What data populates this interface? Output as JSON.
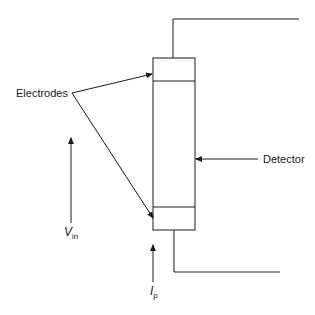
{
  "diagram": {
    "labels": {
      "electrodes": "Electrodes",
      "detector": "Detector",
      "v_in_main": "V",
      "v_in_sub": "in",
      "i_p_main": "I",
      "i_p_sub": "p"
    },
    "colors": {
      "stroke": "#1a1a1a",
      "background": "#ffffff"
    }
  }
}
